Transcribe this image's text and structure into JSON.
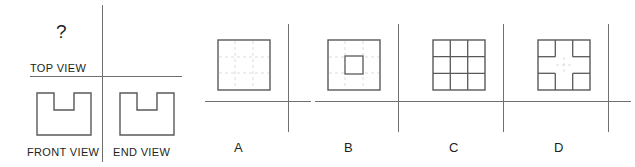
{
  "problem": {
    "question_mark": "?",
    "labels": {
      "top_view": "TOP VIEW",
      "front_view": "FRONT VIEW",
      "end_view": "END VIEW"
    }
  },
  "options": [
    {
      "letter": "A",
      "figure_name": "plain-square-with-hidden-construction-lines",
      "description": "square outline with faint dashed interior construction lines"
    },
    {
      "letter": "B",
      "figure_name": "square-with-centered-small-square",
      "description": "square outline containing one small centered square"
    },
    {
      "letter": "C",
      "figure_name": "three-by-three-grid-square",
      "description": "square outline divided into a 3 by 3 grid of nine cells"
    },
    {
      "letter": "D",
      "figure_name": "square-with-plus-shaped-gap",
      "description": "square outline with four corner cells leaving a plus shaped gap"
    }
  ],
  "colors": {
    "line": "#6f6f6f",
    "outline": "#595959",
    "hidden_line": "#d8d8dc",
    "text": "#231f20",
    "background": "#ffffff"
  }
}
